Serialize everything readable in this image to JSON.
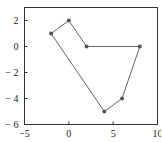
{
  "chart_data": {
    "type": "line",
    "title": "",
    "xlabel": "",
    "ylabel": "",
    "xlim": [
      -5,
      10
    ],
    "ylim": [
      -6,
      3
    ],
    "grid": false,
    "legend": null,
    "x_ticks": [
      "-5",
      "0",
      "5",
      "10"
    ],
    "y_ticks": [
      "2",
      "0",
      "-2",
      "-4",
      "-6"
    ],
    "series": [
      {
        "name": "polygon",
        "closed": true,
        "marker": "circle",
        "color": "#666666",
        "points": [
          [
            -2,
            1
          ],
          [
            0,
            2
          ],
          [
            2,
            0
          ],
          [
            8,
            0
          ],
          [
            6,
            -4
          ],
          [
            4,
            -5
          ],
          [
            -2,
            1
          ]
        ]
      }
    ]
  }
}
